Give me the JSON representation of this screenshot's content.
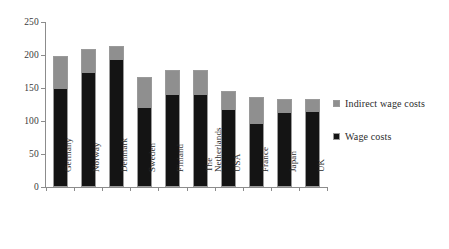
{
  "chart_data": {
    "type": "bar",
    "stacked": true,
    "title": "",
    "xlabel": "",
    "ylabel": "",
    "ylim": [
      0,
      250
    ],
    "ytick_values": [
      0,
      50,
      100,
      150,
      200,
      250
    ],
    "ytick_labels": [
      "0",
      "50",
      "100",
      "150",
      "200",
      "250"
    ],
    "grid": false,
    "legend_position": "right",
    "categories": [
      "Germany",
      "Norway",
      "Denmark",
      "Sweden",
      "Finland",
      "The\nNetherlands",
      "USA",
      "France",
      "Japan",
      "UK"
    ],
    "series": [
      {
        "name": "Wage costs",
        "color": "#141414",
        "values": [
          150,
          173,
          194,
          120,
          140,
          140,
          117,
          96,
          113,
          114
        ]
      },
      {
        "name": "Indirect wage costs",
        "color": "#8f8f8f",
        "values": [
          48,
          36,
          19,
          46,
          38,
          37,
          28,
          41,
          21,
          20
        ]
      }
    ],
    "totals": [
      198,
      209,
      213,
      166,
      178,
      177,
      145,
      137,
      134,
      134
    ]
  },
  "legend": {
    "items": [
      {
        "label": "Indirect wage costs",
        "color": "#8f8f8f"
      },
      {
        "label": "Wage costs",
        "color": "#141414"
      }
    ]
  }
}
